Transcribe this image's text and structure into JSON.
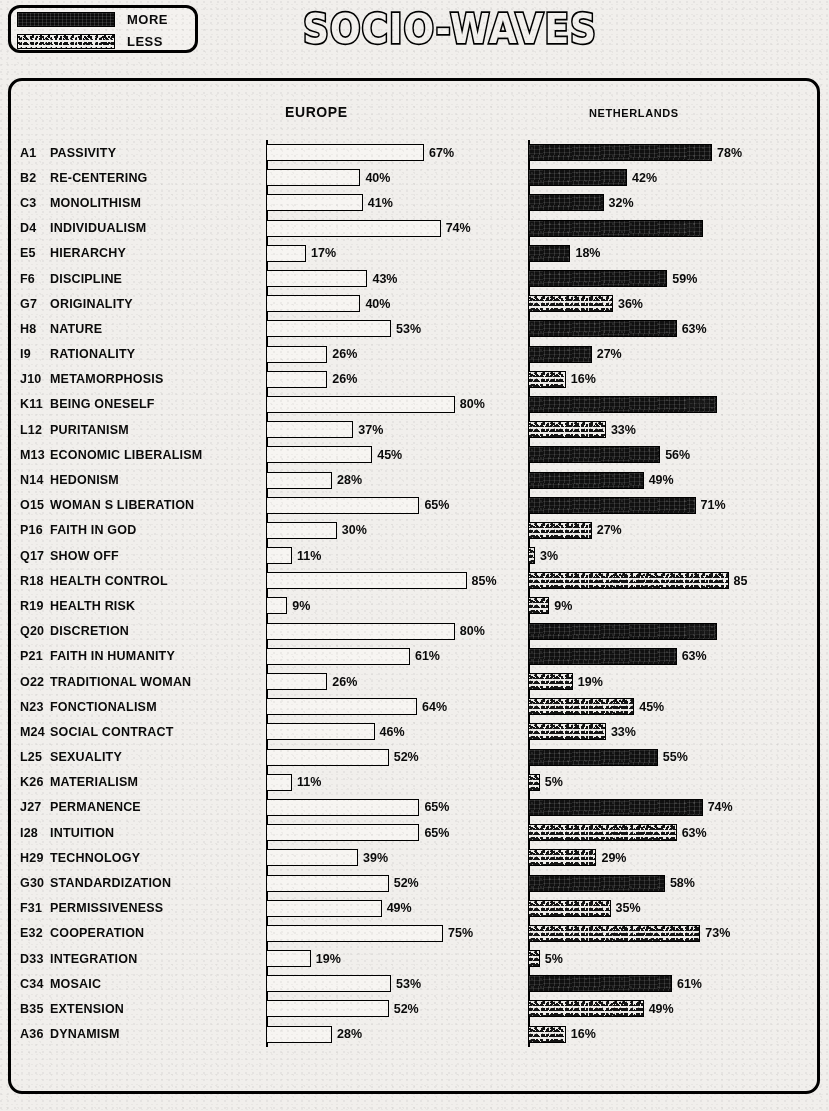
{
  "title": "SOCIO-WAVES",
  "legend": {
    "items": [
      {
        "label": "MORE",
        "swatch": "solid-black-bar",
        "color": "#101010"
      },
      {
        "label": "LESS",
        "swatch": "speckled-bar",
        "color": "#efedea"
      }
    ]
  },
  "headers": {
    "europe": "EUROPE",
    "netherlands": "NETHERLANDS"
  },
  "chart_data": {
    "type": "bar",
    "title": "SOCIO-WAVES",
    "xlabel": "",
    "ylabel": "",
    "xlim": [
      0,
      100
    ],
    "grid": false,
    "orientation": "horizontal",
    "legend_position": "top-left",
    "categories": [
      "A1  PASSIVITY",
      "B2  RE-CENTERING",
      "C3  MONOLITHISM",
      "D4  INDIVIDUALISM",
      "E5  HIERARCHY",
      "F6  DISCIPLINE",
      "G7  ORIGINALITY",
      "H8  NATURE",
      "I9  RATIONALITY",
      "J10  METAMORPHOSIS",
      "K11  BEING ONESELF",
      "L12  PURITANISM",
      "M13  ECONOMIC LIBERALISM",
      "N14  HEDONISM",
      "O15  WOMAN S LIBERATION",
      "P16  FAITH IN GOD",
      "Q17  SHOW OFF",
      "R18  HEALTH CONTROL",
      "R19  HEALTH RISK",
      "Q20  DISCRETION",
      "P21  FAITH IN HUMANITY",
      "O22  TRADITIONAL WOMAN",
      "N23  FONCTIONALISM",
      "M24  SOCIAL CONTRACT",
      "L25  SEXUALITY",
      "K26  MATERIALISM",
      "J27  PERMANENCE",
      "I28  INTUITION",
      "H29  TECHNOLOGY",
      "G30  STANDARDIZATION",
      "F31  PERMISSIVENESS",
      "E32  COOPERATION",
      "D33  INTEGRATION",
      "C34  MOSAIC",
      "B35  EXTENSION",
      "A36  DYNAMISM"
    ],
    "series": [
      {
        "name": "EUROPE",
        "values": [
          67,
          40,
          41,
          74,
          17,
          43,
          40,
          53,
          26,
          26,
          80,
          37,
          45,
          28,
          65,
          30,
          11,
          85,
          9,
          80,
          61,
          26,
          64,
          46,
          52,
          11,
          65,
          65,
          39,
          52,
          49,
          75,
          19,
          53,
          52,
          28
        ]
      },
      {
        "name": "NETHERLANDS",
        "values": [
          78,
          42,
          32,
          74,
          18,
          59,
          36,
          63,
          27,
          16,
          80,
          33,
          56,
          49,
          71,
          27,
          3,
          85,
          9,
          80,
          63,
          19,
          45,
          33,
          55,
          5,
          74,
          63,
          29,
          58,
          35,
          73,
          5,
          61,
          49,
          16
        ]
      }
    ]
  },
  "rows": [
    {
      "code": "A1",
      "name": "PASSIVITY",
      "eu": 67,
      "eu_label": "67%",
      "nl": 78,
      "nl_label": "78%",
      "nl_fill": "more",
      "nl_label_inside": false
    },
    {
      "code": "B2",
      "name": "RE-CENTERING",
      "eu": 40,
      "eu_label": "40%",
      "nl": 42,
      "nl_label": "42%",
      "nl_fill": "more",
      "nl_label_inside": false
    },
    {
      "code": "C3",
      "name": "MONOLITHISM",
      "eu": 41,
      "eu_label": "41%",
      "nl": 32,
      "nl_label": "32%",
      "nl_fill": "more",
      "nl_label_inside": false
    },
    {
      "code": "D4",
      "name": "INDIVIDUALISM",
      "eu": 74,
      "eu_label": "74%",
      "nl": 74,
      "nl_label": "74%",
      "nl_fill": "more",
      "nl_label_inside": true
    },
    {
      "code": "E5",
      "name": "HIERARCHY",
      "eu": 17,
      "eu_label": "17%",
      "nl": 18,
      "nl_label": "18%",
      "nl_fill": "more",
      "nl_label_inside": false
    },
    {
      "code": "F6",
      "name": "DISCIPLINE",
      "eu": 43,
      "eu_label": "43%",
      "nl": 59,
      "nl_label": "59%",
      "nl_fill": "more",
      "nl_label_inside": false
    },
    {
      "code": "G7",
      "name": "ORIGINALITY",
      "eu": 40,
      "eu_label": "40%",
      "nl": 36,
      "nl_label": "36%",
      "nl_fill": "less",
      "nl_label_inside": false
    },
    {
      "code": "H8",
      "name": "NATURE",
      "eu": 53,
      "eu_label": "53%",
      "nl": 63,
      "nl_label": "63%",
      "nl_fill": "more",
      "nl_label_inside": false
    },
    {
      "code": "I9",
      "name": "RATIONALITY",
      "eu": 26,
      "eu_label": "26%",
      "nl": 27,
      "nl_label": "27%",
      "nl_fill": "more",
      "nl_label_inside": false
    },
    {
      "code": "J10",
      "name": "METAMORPHOSIS",
      "eu": 26,
      "eu_label": "26%",
      "nl": 16,
      "nl_label": "16%",
      "nl_fill": "less",
      "nl_label_inside": false
    },
    {
      "code": "K11",
      "name": "BEING ONESELF",
      "eu": 80,
      "eu_label": "80%",
      "nl": 80,
      "nl_label": "80%",
      "nl_fill": "more",
      "nl_label_inside": true
    },
    {
      "code": "L12",
      "name": "PURITANISM",
      "eu": 37,
      "eu_label": "37%",
      "nl": 33,
      "nl_label": "33%",
      "nl_fill": "less",
      "nl_label_inside": false
    },
    {
      "code": "M13",
      "name": "ECONOMIC LIBERALISM",
      "eu": 45,
      "eu_label": "45%",
      "nl": 56,
      "nl_label": "56%",
      "nl_fill": "more",
      "nl_label_inside": false
    },
    {
      "code": "N14",
      "name": "HEDONISM",
      "eu": 28,
      "eu_label": "28%",
      "nl": 49,
      "nl_label": "49%",
      "nl_fill": "more",
      "nl_label_inside": false
    },
    {
      "code": "O15",
      "name": "WOMAN S LIBERATION",
      "eu": 65,
      "eu_label": "65%",
      "nl": 71,
      "nl_label": "71%",
      "nl_fill": "more",
      "nl_label_inside": false
    },
    {
      "code": "P16",
      "name": "FAITH IN GOD",
      "eu": 30,
      "eu_label": "30%",
      "nl": 27,
      "nl_label": "27%",
      "nl_fill": "less",
      "nl_label_inside": false
    },
    {
      "code": "Q17",
      "name": "SHOW OFF",
      "eu": 11,
      "eu_label": "11%",
      "nl": 3,
      "nl_label": "3%",
      "nl_fill": "less",
      "nl_label_inside": false
    },
    {
      "code": "R18",
      "name": "HEALTH CONTROL",
      "eu": 85,
      "eu_label": "85%",
      "nl": 85,
      "nl_label": "85",
      "nl_fill": "less",
      "nl_label_inside": false
    },
    {
      "code": "R19",
      "name": "HEALTH RISK",
      "eu": 9,
      "eu_label": "9%",
      "nl": 9,
      "nl_label": "9%",
      "nl_fill": "less",
      "nl_label_inside": false
    },
    {
      "code": "Q20",
      "name": "DISCRETION",
      "eu": 80,
      "eu_label": "80%",
      "nl": 80,
      "nl_label": "80%",
      "nl_fill": "more",
      "nl_label_inside": true
    },
    {
      "code": "P21",
      "name": "FAITH IN HUMANITY",
      "eu": 61,
      "eu_label": "61%",
      "nl": 63,
      "nl_label": "63%",
      "nl_fill": "more",
      "nl_label_inside": false
    },
    {
      "code": "O22",
      "name": "TRADITIONAL WOMAN",
      "eu": 26,
      "eu_label": "26%",
      "nl": 19,
      "nl_label": "19%",
      "nl_fill": "less",
      "nl_label_inside": false
    },
    {
      "code": "N23",
      "name": "FONCTIONALISM",
      "eu": 64,
      "eu_label": "64%",
      "nl": 45,
      "nl_label": "45%",
      "nl_fill": "less",
      "nl_label_inside": false
    },
    {
      "code": "M24",
      "name": "SOCIAL CONTRACT",
      "eu": 46,
      "eu_label": "46%",
      "nl": 33,
      "nl_label": "33%",
      "nl_fill": "less",
      "nl_label_inside": false
    },
    {
      "code": "L25",
      "name": "SEXUALITY",
      "eu": 52,
      "eu_label": "52%",
      "nl": 55,
      "nl_label": "55%",
      "nl_fill": "more",
      "nl_label_inside": false
    },
    {
      "code": "K26",
      "name": "MATERIALISM",
      "eu": 11,
      "eu_label": "11%",
      "nl": 5,
      "nl_label": "5%",
      "nl_fill": "less",
      "nl_label_inside": false
    },
    {
      "code": "J27",
      "name": "PERMANENCE",
      "eu": 65,
      "eu_label": "65%",
      "nl": 74,
      "nl_label": "74%",
      "nl_fill": "more",
      "nl_label_inside": false
    },
    {
      "code": "I28",
      "name": "INTUITION",
      "eu": 65,
      "eu_label": "65%",
      "nl": 63,
      "nl_label": "63%",
      "nl_fill": "less",
      "nl_label_inside": false
    },
    {
      "code": "H29",
      "name": "TECHNOLOGY",
      "eu": 39,
      "eu_label": "39%",
      "nl": 29,
      "nl_label": "29%",
      "nl_fill": "less",
      "nl_label_inside": false
    },
    {
      "code": "G30",
      "name": "STANDARDIZATION",
      "eu": 52,
      "eu_label": "52%",
      "nl": 58,
      "nl_label": "58%",
      "nl_fill": "more",
      "nl_label_inside": false
    },
    {
      "code": "F31",
      "name": "PERMISSIVENESS",
      "eu": 49,
      "eu_label": "49%",
      "nl": 35,
      "nl_label": "35%",
      "nl_fill": "less",
      "nl_label_inside": false
    },
    {
      "code": "E32",
      "name": "COOPERATION",
      "eu": 75,
      "eu_label": "75%",
      "nl": 73,
      "nl_label": "73%",
      "nl_fill": "less",
      "nl_label_inside": false
    },
    {
      "code": "D33",
      "name": "INTEGRATION",
      "eu": 19,
      "eu_label": "19%",
      "nl": 5,
      "nl_label": "5%",
      "nl_fill": "less",
      "nl_label_inside": false
    },
    {
      "code": "C34",
      "name": "MOSAIC",
      "eu": 53,
      "eu_label": "53%",
      "nl": 61,
      "nl_label": "61%",
      "nl_fill": "more",
      "nl_label_inside": false
    },
    {
      "code": "B35",
      "name": "EXTENSION",
      "eu": 52,
      "eu_label": "52%",
      "nl": 49,
      "nl_label": "49%",
      "nl_fill": "less",
      "nl_label_inside": false
    },
    {
      "code": "A36",
      "name": "DYNAMISM",
      "eu": 28,
      "eu_label": "28%",
      "nl": 16,
      "nl_label": "16%",
      "nl_fill": "less",
      "nl_label_inside": false
    }
  ]
}
